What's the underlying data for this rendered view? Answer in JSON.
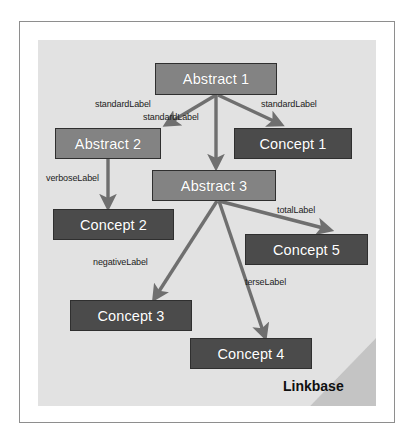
{
  "diagram": {
    "caption": "Linkbase",
    "panel_color": "#e2e2e2",
    "fold_color": "#c4c4c4",
    "frame_color": "#8e8e8e",
    "abstract_color": "#838383",
    "concept_color": "#4b4b4b",
    "edge_color": "#6f6f6f",
    "node_text_color": "#ffffff",
    "label_text_color": "#1c1c1c"
  },
  "nodes": [
    {
      "id": "abstract1",
      "label": "Abstract 1",
      "kind": "abstract",
      "x": 155,
      "y": 63,
      "w": 122,
      "h": 32
    },
    {
      "id": "abstract2",
      "label": "Abstract 2",
      "kind": "abstract",
      "x": 55,
      "y": 128,
      "w": 106,
      "h": 31
    },
    {
      "id": "concept1",
      "label": "Concept 1",
      "kind": "concept",
      "x": 234,
      "y": 128,
      "w": 118,
      "h": 31
    },
    {
      "id": "abstract3",
      "label": "Abstract 3",
      "kind": "abstract",
      "x": 152,
      "y": 170,
      "w": 124,
      "h": 31
    },
    {
      "id": "concept2",
      "label": "Concept 2",
      "kind": "concept",
      "x": 53,
      "y": 209,
      "w": 121,
      "h": 31
    },
    {
      "id": "concept5",
      "label": "Concept 5",
      "kind": "concept",
      "x": 245,
      "y": 234,
      "w": 123,
      "h": 31
    },
    {
      "id": "concept3",
      "label": "Concept 3",
      "kind": "concept",
      "x": 70,
      "y": 300,
      "w": 122,
      "h": 31
    },
    {
      "id": "concept4",
      "label": "Concept 4",
      "kind": "concept",
      "x": 190,
      "y": 338,
      "w": 122,
      "h": 31
    }
  ],
  "edges": [
    {
      "id": "e1",
      "from": "abstract1",
      "to": "abstract2",
      "label": "standardLabel",
      "label_x": 95,
      "label_y": 99
    },
    {
      "id": "e2",
      "from": "abstract1",
      "to": "abstract3",
      "label": "standardLabel",
      "label_x": 143,
      "label_y": 112
    },
    {
      "id": "e3",
      "from": "abstract1",
      "to": "concept1",
      "label": "standardLabel",
      "label_x": 261,
      "label_y": 99
    },
    {
      "id": "e4",
      "from": "abstract2",
      "to": "concept2",
      "label": "verboseLabel",
      "label_x": 46,
      "label_y": 173
    },
    {
      "id": "e5",
      "from": "abstract3",
      "to": "concept5",
      "label": "totalLabel",
      "label_x": 277,
      "label_y": 205
    },
    {
      "id": "e6",
      "from": "abstract3",
      "to": "concept3",
      "label": "negativeLabel",
      "label_x": 93,
      "label_y": 257
    },
    {
      "id": "e7",
      "from": "abstract3",
      "to": "concept4",
      "label": "terseLabel",
      "label_x": 245,
      "label_y": 277
    }
  ]
}
